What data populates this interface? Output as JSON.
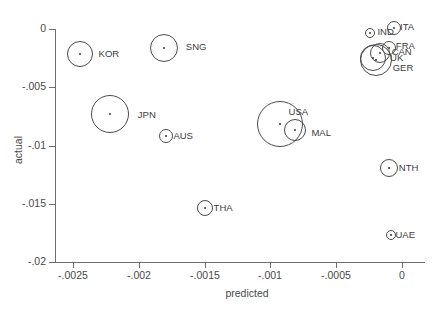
{
  "chart_data": {
    "type": "scatter",
    "title": "",
    "xlabel": "predicted",
    "ylabel": "actual",
    "xlim": [
      -0.00275,
      0.00015
    ],
    "ylim": [
      -0.0205,
      0.0012
    ],
    "grid": false,
    "legend": "none",
    "xticks": [
      {
        "value": -0.0025,
        "label": "-.0025"
      },
      {
        "value": -0.002,
        "label": "-.002"
      },
      {
        "value": -0.0015,
        "label": "-.0015"
      },
      {
        "value": -0.001,
        "label": "-.001"
      },
      {
        "value": -0.0005,
        "label": "-.0005"
      },
      {
        "value": 0,
        "label": "0"
      }
    ],
    "yticks": [
      {
        "value": 0,
        "label": "0"
      },
      {
        "value": -0.005,
        "label": "-.005"
      },
      {
        "value": -0.01,
        "label": "-.01"
      },
      {
        "value": -0.015,
        "label": "-.015"
      },
      {
        "value": -0.02,
        "label": "-.02"
      }
    ],
    "marker_style": "open-circle-with-center-dot",
    "marker_size_encodes": "bubble size",
    "points": [
      {
        "label": "KOR",
        "x": -0.00245,
        "y": -0.00215,
        "r": 13,
        "label_dx": 12,
        "label_dy": -4
      },
      {
        "label": "SNG",
        "x": -0.00181,
        "y": -0.00163,
        "r": 14,
        "label_dx": 14,
        "label_dy": -5
      },
      {
        "label": "JPN",
        "x": -0.00222,
        "y": -0.0073,
        "r": 19,
        "label_dx": 15,
        "label_dy": -3
      },
      {
        "label": "AUS",
        "x": -0.00179,
        "y": -0.00918,
        "r": 7,
        "label_dx": 6,
        "label_dy": -4
      },
      {
        "label": "THA",
        "x": -0.0015,
        "y": -0.01537,
        "r": 8,
        "label_dx": 7,
        "label_dy": -4
      },
      {
        "label": "USA",
        "x": -0.00093,
        "y": -0.00815,
        "r": 23,
        "label_dx": -8,
        "label_dy": -16
      },
      {
        "label": "MAL",
        "x": -0.00081,
        "y": -0.00867,
        "r": 11,
        "label_dx": 11,
        "label_dy": -1
      },
      {
        "label": "ITA",
        "x": -6e-05,
        "y": 5e-05,
        "r": 7,
        "label_dx": 5,
        "label_dy": -5
      },
      {
        "label": "IND",
        "x": -0.00024,
        "y": -0.00034,
        "r": 5,
        "label_dx": 8,
        "label_dy": -5
      },
      {
        "label": "FRA",
        "x": -0.0001,
        "y": -0.0016,
        "r": 7,
        "label_dx": 6,
        "label_dy": -6
      },
      {
        "label": "CAN",
        "x": -0.00017,
        "y": -0.00205,
        "r": 10,
        "label_dx": 8,
        "label_dy": -5
      },
      {
        "label": "UK",
        "x": -0.00022,
        "y": -0.00245,
        "r": 13,
        "label_dx": 10,
        "label_dy": -4
      },
      {
        "label": "GER",
        "x": -0.0002,
        "y": -0.0027,
        "r": 16,
        "label_dx": 7,
        "label_dy": 4
      },
      {
        "label": "NTH",
        "x": -0.0001,
        "y": -0.0119,
        "r": 9,
        "label_dx": 7,
        "label_dy": -4
      },
      {
        "label": "UAE",
        "x": -8e-05,
        "y": -0.0177,
        "r": 5,
        "label_dx": 5,
        "label_dy": -4
      }
    ]
  }
}
